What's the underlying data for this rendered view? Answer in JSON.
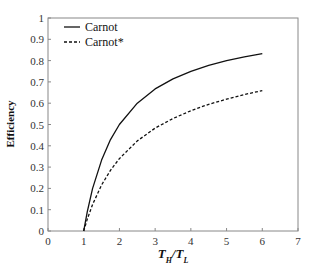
{
  "chart_data": {
    "type": "line",
    "title": "",
    "xlabel": "T_H/T_L",
    "xlabel_parts": {
      "a": "T",
      "a_sub": "H",
      "slash": "/",
      "b": "T",
      "b_sub": "L"
    },
    "ylabel": "Efficiency",
    "xlim": [
      0,
      7
    ],
    "ylim": [
      0,
      1
    ],
    "xticks": [
      "0",
      "1",
      "2",
      "3",
      "4",
      "5",
      "6",
      "7"
    ],
    "yticks": [
      "0",
      "0.1",
      "0.2",
      "0.3",
      "0.4",
      "0.5",
      "0.6",
      "0.7",
      "0.8",
      "0.9",
      "1"
    ],
    "grid": false,
    "legend_position": "top-left",
    "x": [
      1,
      1.1,
      1.25,
      1.5,
      1.75,
      2,
      2.5,
      3,
      3.5,
      4,
      4.5,
      5,
      5.5,
      6
    ],
    "series": [
      {
        "name": "Carnot",
        "style": "solid",
        "values": [
          0,
          0.091,
          0.2,
          0.333,
          0.429,
          0.5,
          0.6,
          0.667,
          0.714,
          0.75,
          0.778,
          0.8,
          0.818,
          0.833
        ]
      },
      {
        "name": "Carnot*",
        "style": "dashed",
        "values": [
          0,
          0.056,
          0.125,
          0.216,
          0.285,
          0.34,
          0.423,
          0.483,
          0.528,
          0.565,
          0.595,
          0.619,
          0.641,
          0.659
        ]
      }
    ]
  }
}
